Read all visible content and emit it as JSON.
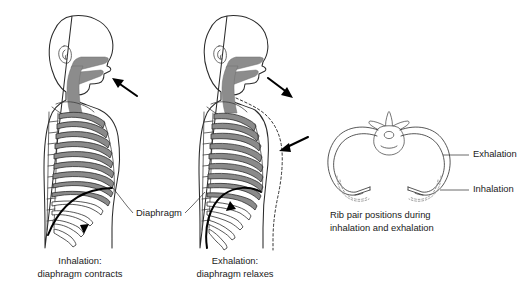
{
  "figure": {
    "title_visible": false,
    "background_color": "#ffffff"
  },
  "colors": {
    "outline": "#2b2b2b",
    "airway_fill": "#8c8c8c",
    "rib_fill": "#8a8a8a",
    "rib_stroke": "#2f2f2f",
    "diaphragm_stroke": "#000000",
    "text": "#1a1a1a",
    "dotted_guide": "#8e8e8e",
    "arrow": "#000000"
  },
  "panels": [
    {
      "id": "inhalation-figure",
      "caption_line1": "Inhalation:",
      "caption_line2": "diaphragm contracts",
      "airflow_arrow": {
        "name": "air-in-arrow",
        "direction": "up-left",
        "meaning": "air flows in"
      },
      "diaphragm_state": "contracted-flattened",
      "diaphragm_motion_arrow": {
        "name": "diaphragm-down-arrow",
        "direction": "down",
        "meaning": "diaphragm moves downward"
      },
      "rib_count": 10,
      "has_dotted_outline": false
    },
    {
      "id": "exhalation-figure",
      "caption_line1": "Exhalation:",
      "caption_line2": "diaphragm relaxes",
      "airflow_arrow": {
        "name": "air-out-arrow",
        "direction": "down-right",
        "meaning": "air flows out"
      },
      "chest_wall_arrow": {
        "name": "chest-wall-inward-arrow",
        "direction": "left",
        "meaning": "chest wall moves inward"
      },
      "diaphragm_state": "relaxed-domed",
      "diaphragm_motion_arrow": {
        "name": "diaphragm-up-arrow",
        "direction": "up",
        "meaning": "diaphragm moves upward"
      },
      "rib_count": 10,
      "has_dotted_outline": true,
      "dotted_outline_meaning": "chest position during inhalation"
    }
  ],
  "annotations": {
    "diaphragm_label": "Diaphragm"
  },
  "rib_pair_panel": {
    "id": "rib-pair-cross-section",
    "caption_line1": "Rib pair positions during",
    "caption_line2": "inhalation and exhalation",
    "labels": [
      {
        "name": "exhalation-position-label",
        "text": "Exhalation",
        "style": "solid"
      },
      {
        "name": "inhalation-position-label",
        "text": "Inhalation",
        "style": "dotted"
      }
    ],
    "vertebra_present": true
  }
}
